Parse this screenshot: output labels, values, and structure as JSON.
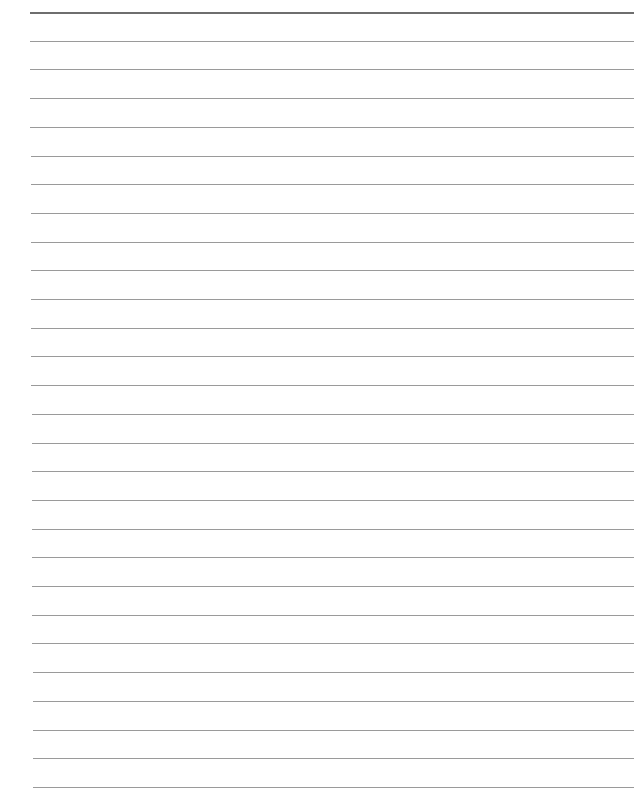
{
  "document": {
    "type": "lined-paper",
    "background_color": "#ffffff",
    "line_color": "#9a9a9a",
    "top_line_color": "#6e6e6e",
    "line_count": 28,
    "first_line_y": 12,
    "line_spacing": 28.7,
    "line_left": 30,
    "line_right": 634,
    "text_content": []
  }
}
